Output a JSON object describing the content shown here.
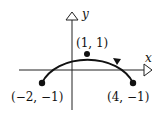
{
  "axes": {
    "x_label": "x",
    "y_label": "y"
  },
  "points": [
    {
      "name": "top",
      "label": "(1, 1)"
    },
    {
      "name": "left",
      "label": "(−2, −1)"
    },
    {
      "name": "right",
      "label": "(4, −1)"
    }
  ],
  "curve": {
    "type": "arc",
    "direction": "counterclockwise from (4,-1) to (-2,-1)"
  },
  "colors": {
    "ink": "#111111",
    "background": "#ffffff"
  }
}
